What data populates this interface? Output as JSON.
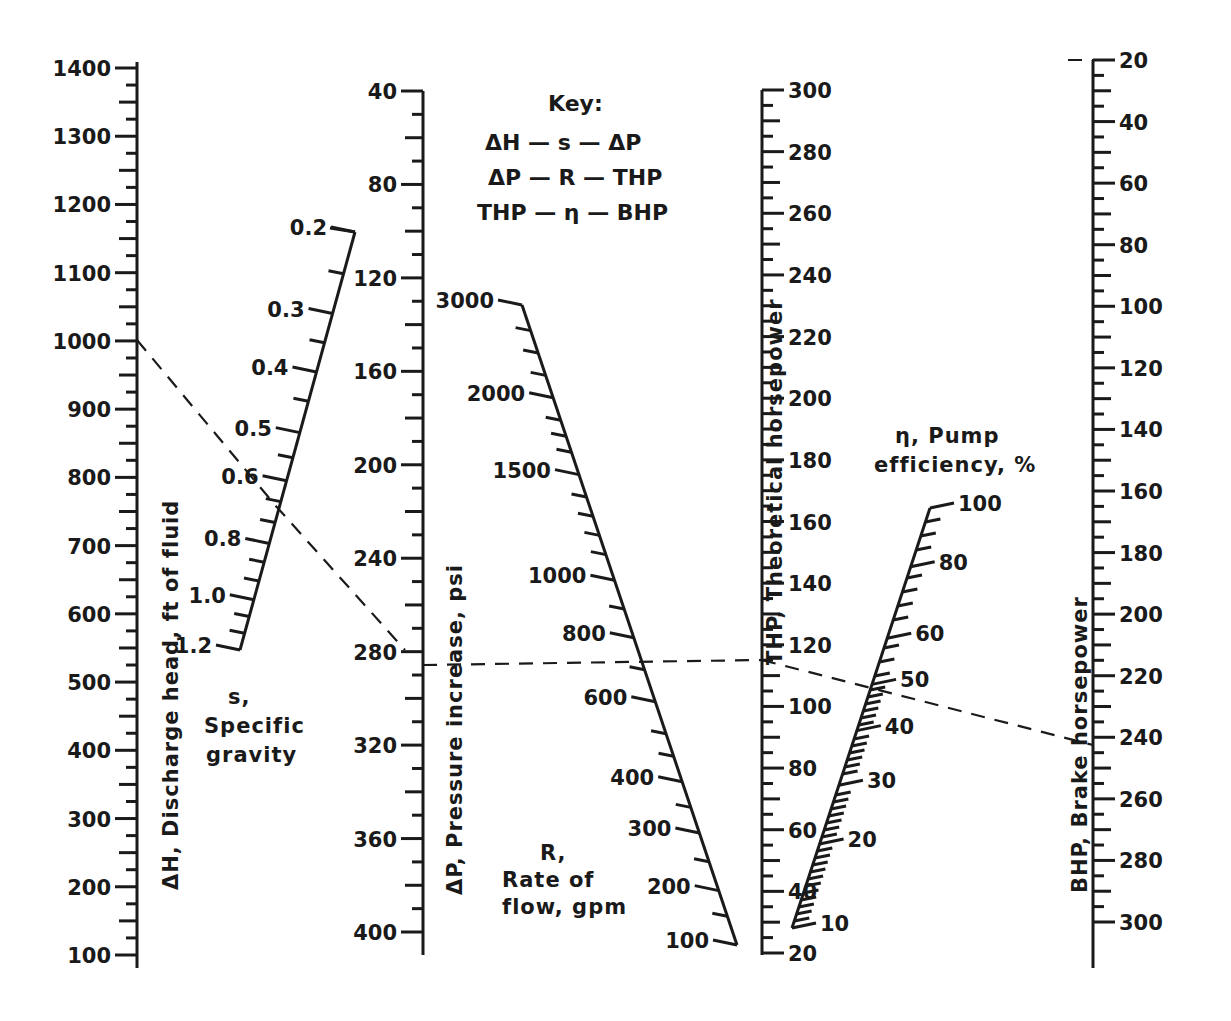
{
  "chart_data": {
    "type": "nomogram",
    "key": {
      "heading": "Key:",
      "lines": [
        "ΔH — s — ΔP",
        "ΔP — R — THP",
        "THP — η — BHP"
      ]
    },
    "scales": [
      {
        "id": "dH",
        "label": "ΔH, Discharge head, ft of fluid",
        "orientation": "vertical",
        "range": [
          100,
          1400
        ],
        "major_ticks": [
          1400,
          1300,
          1200,
          1100,
          1000,
          900,
          800,
          700,
          600,
          500,
          400,
          300,
          200,
          100
        ],
        "minor_step": 25
      },
      {
        "id": "s",
        "label_lines": [
          "s,",
          "Specific",
          "gravity"
        ],
        "orientation": "slanted",
        "labels": [
          "0.2",
          "0.3",
          "0.4",
          "0.5",
          "0.6",
          "0.8",
          "1.0",
          "1.2"
        ]
      },
      {
        "id": "dP",
        "label": "ΔP, Pressure increase, psi",
        "orientation": "vertical",
        "range": [
          40,
          400
        ],
        "major_ticks": [
          40,
          80,
          120,
          160,
          200,
          240,
          280,
          320,
          360,
          400
        ],
        "minor_step": 10
      },
      {
        "id": "R",
        "label_lines": [
          "R,",
          "Rate of",
          "flow, gpm"
        ],
        "orientation": "slanted",
        "labels": [
          "3000",
          "2000",
          "1500",
          "1000",
          "800",
          "600",
          "400",
          "300",
          "200",
          "100"
        ]
      },
      {
        "id": "THP",
        "label": "THP, Theoretical horsepower",
        "orientation": "vertical",
        "range": [
          20,
          300
        ],
        "major_ticks": [
          300,
          280,
          260,
          240,
          220,
          200,
          180,
          160,
          140,
          120,
          100,
          80,
          60,
          40,
          20
        ],
        "minor_step": 5
      },
      {
        "id": "eta",
        "label_lines": [
          "η, Pump",
          "efficiency, %"
        ],
        "orientation": "slanted",
        "labels": [
          "100",
          "80",
          "60",
          "50",
          "40",
          "30",
          "20",
          "10"
        ]
      },
      {
        "id": "BHP",
        "label": "BHP, Brake horsepower",
        "orientation": "vertical",
        "range": [
          20,
          300
        ],
        "major_ticks": [
          20,
          40,
          60,
          80,
          100,
          120,
          140,
          160,
          180,
          200,
          220,
          240,
          260,
          280,
          300
        ],
        "minor_step": 5
      }
    ],
    "example_solution": {
      "dH": 1000,
      "s": 0.65,
      "dP": 285,
      "R": 700,
      "THP": 116,
      "eta": 48,
      "BHP": 242
    }
  },
  "labels": {
    "dH_title": "ΔH, Discharge head, ft of fluid",
    "dP_title": "ΔP, Pressure increase, psi",
    "THP_title": "THP, Theoretical horsepower",
    "BHP_title": "BHP, Brake horsepower",
    "s_title": [
      "s,",
      "Specific",
      "gravity"
    ],
    "R_title": [
      "R,",
      "Rate of",
      "flow, gpm"
    ],
    "eta_title": [
      "η, Pump",
      "efficiency, %"
    ],
    "key_heading": "Key:",
    "key_lines": [
      "ΔH — s — ΔP",
      "ΔP — R — THP",
      "THP — η — BHP"
    ]
  }
}
